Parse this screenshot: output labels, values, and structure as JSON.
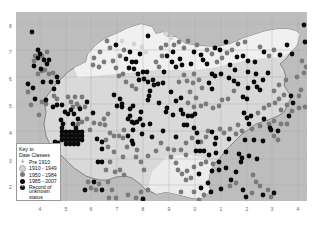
{
  "map": {
    "title": "Distribution map by date class",
    "colors": {
      "sea": "#bdbdbd",
      "land": "#d9d9d9",
      "land_light": "#f2f2f2",
      "grid": "#a8a8a8",
      "coast": "#707070",
      "class_1910_1949": "#d4d4d4",
      "class_1950_1984": "#7a7a7a",
      "class_1985_2007": "#0a0a0a",
      "unknown": "#111111"
    },
    "x_axis_labels": [
      "4",
      "5",
      "6",
      "7",
      "8",
      "9",
      "0",
      "1",
      "2",
      "3",
      "4"
    ],
    "y_axis_labels": [
      "8",
      "7",
      "6",
      "5",
      "4",
      "3",
      "2"
    ]
  },
  "legend": {
    "title_line1": "Key to",
    "title_line2": "Date Classes",
    "items": [
      {
        "label": "Pre 1910",
        "symbol": "plus"
      },
      {
        "label": "1910 - 1949",
        "symbol": "light-dot"
      },
      {
        "label": "1950 - 1984",
        "symbol": "grey-dot"
      },
      {
        "label": "1985 - 2007",
        "symbol": "black-dot"
      },
      {
        "label": "Record of",
        "symbol": "star-dot"
      }
    ],
    "unknown_line2": "unknown status"
  },
  "records": {
    "black": [
      [
        16,
        20
      ],
      [
        22,
        38
      ],
      [
        24,
        42
      ],
      [
        22,
        46
      ],
      [
        18,
        54
      ],
      [
        25,
        57
      ],
      [
        28,
        48
      ],
      [
        31,
        52
      ],
      [
        33,
        48
      ],
      [
        27,
        70
      ],
      [
        35,
        70
      ],
      [
        38,
        77
      ],
      [
        41,
        65
      ],
      [
        42,
        70
      ],
      [
        12,
        72
      ],
      [
        17,
        76
      ],
      [
        19,
        87
      ],
      [
        30,
        88
      ],
      [
        37,
        95
      ],
      [
        41,
        93
      ],
      [
        46,
        93
      ],
      [
        49,
        100
      ],
      [
        55,
        98
      ],
      [
        52,
        102
      ],
      [
        58,
        102
      ],
      [
        64,
        97
      ],
      [
        71,
        90
      ],
      [
        45,
        108
      ],
      [
        47,
        112
      ],
      [
        57,
        112
      ],
      [
        46,
        116
      ],
      [
        60,
        116
      ],
      [
        46,
        120
      ],
      [
        50,
        120
      ],
      [
        54,
        120
      ],
      [
        58,
        120
      ],
      [
        62,
        120
      ],
      [
        66,
        120
      ],
      [
        46,
        124
      ],
      [
        50,
        124
      ],
      [
        54,
        124
      ],
      [
        58,
        124
      ],
      [
        62,
        124
      ],
      [
        66,
        124
      ],
      [
        46,
        128
      ],
      [
        50,
        128
      ],
      [
        54,
        128
      ],
      [
        58,
        128
      ],
      [
        62,
        128
      ],
      [
        66,
        128
      ],
      [
        50,
        132
      ],
      [
        54,
        132
      ],
      [
        58,
        132
      ],
      [
        62,
        132
      ],
      [
        39,
        130
      ],
      [
        42,
        131
      ],
      [
        41,
        137
      ],
      [
        62,
        107
      ],
      [
        77,
        101
      ],
      [
        81,
        127
      ],
      [
        86,
        130
      ],
      [
        86,
        137
      ],
      [
        82,
        150
      ],
      [
        86,
        150
      ],
      [
        98,
        83
      ],
      [
        104,
        87
      ],
      [
        106,
        92
      ],
      [
        101,
        94
      ],
      [
        106,
        95
      ],
      [
        114,
        97
      ],
      [
        117,
        94
      ],
      [
        114,
        104
      ],
      [
        112,
        107
      ],
      [
        116,
        110
      ],
      [
        118,
        111
      ],
      [
        121,
        110
      ],
      [
        124,
        107
      ],
      [
        117,
        118
      ],
      [
        126,
        122
      ],
      [
        134,
        112
      ],
      [
        147,
        119
      ],
      [
        160,
        125
      ],
      [
        143,
        91
      ],
      [
        155,
        80
      ],
      [
        160,
        89
      ],
      [
        165,
        86
      ],
      [
        157,
        103
      ],
      [
        165,
        98
      ],
      [
        167,
        102
      ],
      [
        172,
        104
      ],
      [
        176,
        104
      ],
      [
        179,
        102
      ],
      [
        168,
        113
      ],
      [
        171,
        113
      ],
      [
        178,
        116
      ],
      [
        181,
        121
      ],
      [
        182,
        130
      ],
      [
        196,
        120
      ],
      [
        200,
        126
      ],
      [
        199,
        132
      ],
      [
        180,
        139
      ],
      [
        184,
        139
      ],
      [
        188,
        139
      ],
      [
        200,
        141
      ],
      [
        193,
        143
      ],
      [
        203,
        150
      ],
      [
        210,
        140
      ],
      [
        183,
        162
      ],
      [
        196,
        159
      ],
      [
        203,
        158
      ],
      [
        210,
        156
      ],
      [
        220,
        160
      ],
      [
        225,
        150
      ],
      [
        226,
        146
      ],
      [
        213,
        127
      ],
      [
        229,
        128
      ],
      [
        238,
        128
      ],
      [
        247,
        129
      ],
      [
        223,
        142
      ],
      [
        233,
        144
      ],
      [
        241,
        147
      ],
      [
        228,
        101
      ],
      [
        231,
        106
      ],
      [
        235,
        104
      ],
      [
        233,
        112
      ],
      [
        248,
        107
      ],
      [
        254,
        116
      ],
      [
        255,
        118
      ],
      [
        262,
        119
      ],
      [
        275,
        84
      ],
      [
        277,
        91
      ],
      [
        222,
        72
      ],
      [
        232,
        76
      ],
      [
        227,
        85
      ],
      [
        231,
        87
      ],
      [
        238,
        70
      ],
      [
        241,
        75
      ],
      [
        244,
        78
      ],
      [
        247,
        68
      ],
      [
        252,
        61
      ],
      [
        232,
        60
      ],
      [
        196,
        62
      ],
      [
        193,
        71
      ],
      [
        196,
        77
      ],
      [
        199,
        64
      ],
      [
        205,
        62
      ],
      [
        213,
        66
      ],
      [
        218,
        69
      ],
      [
        134,
        79
      ],
      [
        133,
        84
      ],
      [
        132,
        88
      ],
      [
        125,
        100
      ],
      [
        127,
        113
      ],
      [
        112,
        124
      ],
      [
        116,
        129
      ],
      [
        117,
        132
      ],
      [
        136,
        125
      ],
      [
        150,
        100
      ],
      [
        151,
        96
      ],
      [
        128,
        67
      ],
      [
        132,
        70
      ],
      [
        137,
        68
      ],
      [
        138,
        73
      ],
      [
        142,
        72
      ],
      [
        147,
        71
      ],
      [
        110,
        47
      ],
      [
        113,
        56
      ],
      [
        123,
        68
      ],
      [
        114,
        40
      ],
      [
        116,
        50
      ],
      [
        120,
        50
      ],
      [
        118,
        57
      ],
      [
        127,
        60
      ],
      [
        131,
        60
      ],
      [
        122,
        62
      ],
      [
        124,
        42
      ],
      [
        100,
        33
      ],
      [
        132,
        24
      ],
      [
        148,
        60
      ],
      [
        157,
        40
      ],
      [
        151,
        44
      ],
      [
        156,
        50
      ],
      [
        160,
        55
      ],
      [
        164,
        47
      ],
      [
        166,
        53
      ],
      [
        175,
        52
      ],
      [
        178,
        40
      ],
      [
        185,
        43
      ],
      [
        187,
        48
      ],
      [
        199,
        36
      ],
      [
        204,
        38
      ],
      [
        210,
        30
      ],
      [
        221,
        45
      ],
      [
        227,
        44
      ],
      [
        232,
        49
      ],
      [
        239,
        50
      ],
      [
        248,
        40
      ],
      [
        264,
        43
      ],
      [
        271,
        33
      ],
      [
        276,
        42
      ],
      [
        288,
        13
      ],
      [
        289,
        30
      ],
      [
        240,
        62
      ],
      [
        219,
        58
      ],
      [
        214,
        53
      ],
      [
        191,
        52
      ],
      [
        273,
        104
      ],
      [
        69,
        178
      ],
      [
        78,
        170
      ],
      [
        86,
        178
      ],
      [
        117,
        194
      ],
      [
        127,
        187
      ],
      [
        142,
        194
      ],
      [
        185,
        176
      ],
      [
        192,
        171
      ],
      [
        195,
        180
      ],
      [
        205,
        177
      ],
      [
        215,
        168
      ],
      [
        227,
        178
      ],
      [
        230,
        185
      ],
      [
        247,
        183
      ],
      [
        258,
        181
      ]
    ],
    "grey": [
      [
        19,
        44
      ],
      [
        26,
        44
      ],
      [
        31,
        40
      ],
      [
        18,
        49
      ],
      [
        29,
        58
      ],
      [
        22,
        62
      ],
      [
        26,
        59
      ],
      [
        33,
        62
      ],
      [
        37,
        61
      ],
      [
        12,
        80
      ],
      [
        15,
        93
      ],
      [
        23,
        103
      ],
      [
        26,
        90
      ],
      [
        30,
        92
      ],
      [
        38,
        84
      ],
      [
        41,
        87
      ],
      [
        52,
        85
      ],
      [
        55,
        90
      ],
      [
        59,
        85
      ],
      [
        61,
        92
      ],
      [
        66,
        85
      ],
      [
        57,
        95
      ],
      [
        63,
        95
      ],
      [
        69,
        95
      ],
      [
        66,
        110
      ],
      [
        71,
        107
      ],
      [
        62,
        112
      ],
      [
        74,
        118
      ],
      [
        78,
        111
      ],
      [
        84,
        112
      ],
      [
        88,
        107
      ],
      [
        92,
        102
      ],
      [
        89,
        113
      ],
      [
        94,
        121
      ],
      [
        98,
        124
      ],
      [
        103,
        124
      ],
      [
        107,
        126
      ],
      [
        108,
        118
      ],
      [
        90,
        128
      ],
      [
        92,
        135
      ],
      [
        98,
        140
      ],
      [
        111,
        135
      ],
      [
        121,
        138
      ],
      [
        107,
        145
      ],
      [
        94,
        150
      ],
      [
        90,
        158
      ],
      [
        99,
        160
      ],
      [
        104,
        158
      ],
      [
        108,
        163
      ],
      [
        120,
        145
      ],
      [
        125,
        150
      ],
      [
        128,
        158
      ],
      [
        132,
        144
      ],
      [
        140,
        139
      ],
      [
        145,
        131
      ],
      [
        152,
        137
      ],
      [
        155,
        145
      ],
      [
        160,
        151
      ],
      [
        158,
        138
      ],
      [
        165,
        138
      ],
      [
        170,
        131
      ],
      [
        176,
        126
      ],
      [
        170,
        143
      ],
      [
        162,
        158
      ],
      [
        166,
        162
      ],
      [
        171,
        159
      ],
      [
        175,
        166
      ],
      [
        170,
        168
      ],
      [
        178,
        155
      ],
      [
        185,
        152
      ],
      [
        190,
        150
      ],
      [
        197,
        152
      ],
      [
        185,
        130
      ],
      [
        190,
        125
      ],
      [
        192,
        119
      ],
      [
        204,
        117
      ],
      [
        208,
        121
      ],
      [
        214,
        117
      ],
      [
        220,
        122
      ],
      [
        222,
        113
      ],
      [
        226,
        119
      ],
      [
        236,
        117
      ],
      [
        244,
        114
      ],
      [
        253,
        112
      ],
      [
        258,
        109
      ],
      [
        265,
        112
      ],
      [
        271,
        112
      ],
      [
        258,
        124
      ],
      [
        262,
        128
      ],
      [
        242,
        101
      ],
      [
        248,
        96
      ],
      [
        253,
        93
      ],
      [
        259,
        91
      ],
      [
        265,
        98
      ],
      [
        263,
        87
      ],
      [
        268,
        83
      ],
      [
        271,
        93
      ],
      [
        276,
        99
      ],
      [
        283,
        96
      ],
      [
        289,
        95
      ],
      [
        285,
        78
      ],
      [
        283,
        84
      ],
      [
        258,
        79
      ],
      [
        263,
        73
      ],
      [
        270,
        68
      ],
      [
        218,
        79
      ],
      [
        212,
        87
      ],
      [
        206,
        88
      ],
      [
        203,
        94
      ],
      [
        197,
        96
      ],
      [
        190,
        92
      ],
      [
        185,
        94
      ],
      [
        180,
        86
      ],
      [
        174,
        80
      ],
      [
        172,
        91
      ],
      [
        178,
        95
      ],
      [
        163,
        70
      ],
      [
        168,
        63
      ],
      [
        171,
        69
      ],
      [
        177,
        71
      ],
      [
        183,
        68
      ],
      [
        186,
        76
      ],
      [
        178,
        62
      ],
      [
        140,
        50
      ],
      [
        143,
        55
      ],
      [
        146,
        44
      ],
      [
        145,
        36
      ],
      [
        150,
        33
      ],
      [
        103,
        64
      ],
      [
        107,
        62
      ],
      [
        110,
        70
      ],
      [
        116,
        74
      ],
      [
        120,
        77
      ],
      [
        100,
        56
      ],
      [
        97,
        49
      ],
      [
        104,
        44
      ],
      [
        108,
        38
      ],
      [
        91,
        29
      ],
      [
        94,
        36
      ],
      [
        84,
        40
      ],
      [
        78,
        46
      ],
      [
        77,
        53
      ],
      [
        83,
        55
      ],
      [
        88,
        50
      ],
      [
        158,
        33
      ],
      [
        163,
        30
      ],
      [
        168,
        36
      ],
      [
        172,
        29
      ],
      [
        181,
        33
      ],
      [
        191,
        38
      ],
      [
        196,
        42
      ],
      [
        201,
        50
      ],
      [
        206,
        46
      ],
      [
        211,
        41
      ],
      [
        216,
        38
      ],
      [
        222,
        32
      ],
      [
        229,
        30
      ],
      [
        244,
        35
      ],
      [
        253,
        44
      ],
      [
        258,
        38
      ],
      [
        286,
        49
      ],
      [
        290,
        55
      ],
      [
        288,
        61
      ],
      [
        281,
        65
      ],
      [
        72,
        170
      ],
      [
        75,
        176
      ],
      [
        80,
        178
      ],
      [
        83,
        172
      ],
      [
        92,
        170
      ],
      [
        96,
        178
      ],
      [
        93,
        186
      ],
      [
        100,
        186
      ],
      [
        112,
        183
      ],
      [
        120,
        186
      ],
      [
        125,
        180
      ],
      [
        132,
        178
      ],
      [
        165,
        180
      ],
      [
        178,
        180
      ],
      [
        183,
        188
      ],
      [
        188,
        183
      ],
      [
        214,
        174
      ],
      [
        220,
        171
      ],
      [
        236,
        181
      ],
      [
        244,
        174
      ],
      [
        252,
        178
      ],
      [
        255,
        185
      ],
      [
        237,
        163
      ],
      [
        240,
        170
      ]
    ],
    "light": [
      [
        150,
        22
      ],
      [
        155,
        26
      ],
      [
        130,
        40
      ],
      [
        126,
        35
      ],
      [
        106,
        29
      ],
      [
        118,
        32
      ]
    ]
  }
}
